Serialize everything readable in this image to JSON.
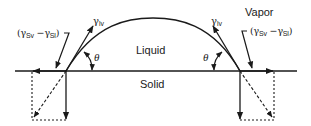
{
  "diagram": {
    "regions": {
      "liquid": "Liquid",
      "solid": "Solid",
      "vapor": "Vapor"
    },
    "symbols": {
      "gamma": "γ",
      "theta": "θ",
      "lv_sub": "lv",
      "sv_sub": "Sv",
      "sl_sub": "Sl",
      "open_paren": "(",
      "minus": " −",
      "close_paren": ")"
    },
    "left_contact": {
      "gamma_lv_label": "γlv",
      "theta_label": "θ",
      "difference_label": "(γSv − γSl)"
    },
    "right_contact": {
      "gamma_lv_label": "γlv",
      "theta_label": "θ",
      "difference_label": "(γSv − γSl)"
    },
    "colors": {
      "stroke": "#1a1a1a",
      "background": "#ffffff"
    }
  }
}
